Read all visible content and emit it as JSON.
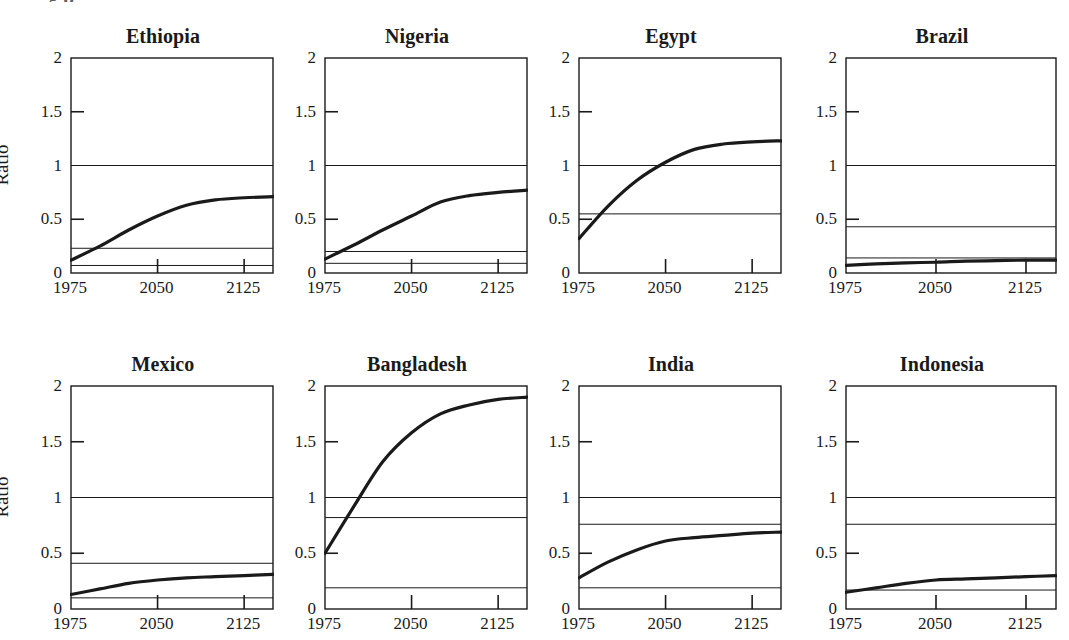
{
  "figure": {
    "width": 1069,
    "height": 640,
    "background": "#ffffff",
    "ink": "#1a1a1a",
    "rows": 2,
    "cols": 4,
    "y_axis_title": "Ratio",
    "clipped_header": "g p"
  },
  "axes": {
    "ylim": [
      0,
      2
    ],
    "yticks": [
      0,
      0.5,
      1,
      1.5,
      2
    ],
    "ytick_labels": [
      "0",
      "0.5",
      "1",
      "1.5",
      "2"
    ],
    "xlim": [
      1975,
      2150
    ],
    "xticks": [
      1975,
      2050,
      2125
    ],
    "xtick_labels": [
      "1975",
      "2050",
      "2125"
    ],
    "grid": false,
    "tick_direction": "in"
  },
  "chart_data": {
    "type": "line",
    "title": "",
    "subtitle": "",
    "xlabel": "",
    "ylabel": "Ratio",
    "xlim": [
      1975,
      2150
    ],
    "ylim": [
      0,
      2
    ],
    "xticks": [
      1975,
      2050,
      2125
    ],
    "yticks": [
      0,
      0.5,
      1,
      1.5,
      2
    ],
    "grid": false,
    "legend": "none",
    "layout": "2 rows x 4 columns of small-multiple panels",
    "shared_reference_line": 1.0,
    "panels": [
      {
        "name": "Ethiopia",
        "row": 0,
        "col": 0,
        "x": [
          1975,
          2000,
          2025,
          2050,
          2075,
          2100,
          2125,
          2150
        ],
        "values": [
          0.12,
          0.25,
          0.4,
          0.53,
          0.63,
          0.68,
          0.7,
          0.71
        ],
        "reference_lines": [
          1.0,
          0.23,
          0.07
        ]
      },
      {
        "name": "Nigeria",
        "row": 0,
        "col": 1,
        "x": [
          1975,
          2000,
          2025,
          2050,
          2075,
          2100,
          2125,
          2150
        ],
        "values": [
          0.13,
          0.26,
          0.4,
          0.53,
          0.66,
          0.72,
          0.75,
          0.77
        ],
        "reference_lines": [
          1.0,
          0.2,
          0.09
        ]
      },
      {
        "name": "Egypt",
        "row": 0,
        "col": 2,
        "x": [
          1975,
          2000,
          2025,
          2050,
          2075,
          2100,
          2125,
          2150
        ],
        "values": [
          0.32,
          0.62,
          0.86,
          1.03,
          1.15,
          1.2,
          1.22,
          1.23
        ],
        "reference_lines": [
          1.0,
          0.55
        ]
      },
      {
        "name": "Brazil",
        "row": 0,
        "col": 3,
        "x": [
          1975,
          2000,
          2025,
          2050,
          2075,
          2100,
          2125,
          2150
        ],
        "values": [
          0.07,
          0.085,
          0.095,
          0.1,
          0.11,
          0.115,
          0.12,
          0.12
        ],
        "reference_lines": [
          1.0,
          0.43,
          0.14
        ]
      },
      {
        "name": "Mexico",
        "row": 1,
        "col": 0,
        "x": [
          1975,
          2000,
          2025,
          2050,
          2075,
          2100,
          2125,
          2150
        ],
        "values": [
          0.13,
          0.18,
          0.23,
          0.26,
          0.28,
          0.29,
          0.3,
          0.31
        ],
        "reference_lines": [
          1.0,
          0.41,
          0.1
        ]
      },
      {
        "name": "Bangladesh",
        "row": 1,
        "col": 1,
        "x": [
          1975,
          2000,
          2025,
          2050,
          2075,
          2100,
          2125,
          2150
        ],
        "values": [
          0.5,
          0.92,
          1.32,
          1.58,
          1.75,
          1.83,
          1.88,
          1.9
        ],
        "reference_lines": [
          1.0,
          0.82,
          0.19
        ]
      },
      {
        "name": "India",
        "row": 1,
        "col": 2,
        "x": [
          1975,
          2000,
          2025,
          2050,
          2075,
          2100,
          2125,
          2150
        ],
        "values": [
          0.28,
          0.42,
          0.53,
          0.61,
          0.64,
          0.66,
          0.68,
          0.69
        ],
        "reference_lines": [
          1.0,
          0.76,
          0.19
        ]
      },
      {
        "name": "Indonesia",
        "row": 1,
        "col": 3,
        "x": [
          1975,
          2000,
          2025,
          2050,
          2075,
          2100,
          2125,
          2150
        ],
        "values": [
          0.15,
          0.19,
          0.23,
          0.26,
          0.27,
          0.28,
          0.29,
          0.3
        ],
        "reference_lines": [
          1.0,
          0.76,
          0.17
        ]
      }
    ]
  }
}
